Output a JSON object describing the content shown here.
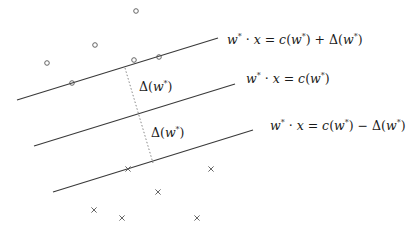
{
  "diagram": {
    "type": "margin-separating-hyperplanes",
    "colors": {
      "line": "#3a3a3a",
      "marker": "#555555",
      "dotted": "#888888"
    },
    "hyperplanes": [
      {
        "id": "upper",
        "x1": 17,
        "y1": 100,
        "x2": 218,
        "y2": 38,
        "label": {
          "lhs": "w",
          "lhs_sup": "*",
          "op": " · x = ",
          "rhs": "c(w",
          "rhs_sup": "*",
          "rhs_tail": ") + Δ(w",
          "tail_sup": "*",
          "end": ")"
        },
        "label_text": "w* · x = c(w*) + Δ(w*)",
        "label_x": 227,
        "label_y": 34
      },
      {
        "id": "middle",
        "x1": 34,
        "y1": 146,
        "x2": 235,
        "y2": 84,
        "label_text": "w* · x = c(w*)",
        "label_x": 246,
        "label_y": 73
      },
      {
        "id": "lower",
        "x1": 53,
        "y1": 192,
        "x2": 253,
        "y2": 130,
        "label_text": "w* · x = c(w*) − Δ(w*)",
        "label_x": 270,
        "label_y": 120
      }
    ],
    "margin_segment": {
      "x1": 125,
      "y1": 68,
      "x2": 153,
      "y2": 163
    },
    "margin_labels": [
      {
        "text": "Δ(w*)",
        "x": 139,
        "y": 81
      },
      {
        "text": "Δ(w*)",
        "x": 151,
        "y": 127
      }
    ],
    "positive_points": [
      {
        "x": 136,
        "y": 11
      },
      {
        "x": 95,
        "y": 45
      },
      {
        "x": 47,
        "y": 63
      },
      {
        "x": 134,
        "y": 60
      },
      {
        "x": 159,
        "y": 57
      },
      {
        "x": 72,
        "y": 83
      }
    ],
    "negative_points": [
      {
        "x": 128,
        "y": 169
      },
      {
        "x": 211,
        "y": 169
      },
      {
        "x": 158,
        "y": 192
      },
      {
        "x": 94,
        "y": 210
      },
      {
        "x": 122,
        "y": 218
      },
      {
        "x": 197,
        "y": 218
      }
    ]
  }
}
